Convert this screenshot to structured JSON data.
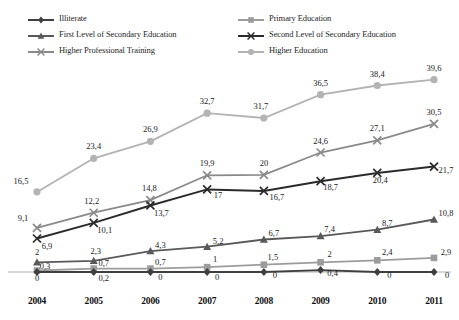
{
  "chart_data": {
    "type": "line",
    "title": "",
    "xlabel": "",
    "ylabel": "",
    "categories": [
      "2004",
      "2005",
      "2006",
      "2007",
      "2008",
      "2009",
      "2010",
      "2011"
    ],
    "ylim": [
      0,
      42
    ],
    "grid": false,
    "legend_position": "top",
    "series": [
      {
        "name": "Illiterate",
        "color": "#3f3f3f",
        "marker": "diamond",
        "values": [
          0,
          0,
          0,
          0,
          0,
          0.4,
          0,
          0
        ],
        "labels": [
          "0",
          "0,2",
          "0",
          "0",
          "0",
          "0,4",
          "0",
          "0"
        ]
      },
      {
        "name": "Primary Education",
        "color": "#9c9c9c",
        "marker": "square",
        "values": [
          0.3,
          0.7,
          0.7,
          1,
          1.5,
          2,
          2.4,
          2.9
        ],
        "labels": [
          "0,3",
          "0,7",
          "0,7",
          "1",
          "1,5",
          "2",
          "2,4",
          "2,9"
        ]
      },
      {
        "name": "First Level of Secondary Education",
        "color": "#595959",
        "marker": "triangle",
        "values": [
          2,
          2.3,
          4.3,
          5.2,
          6.7,
          7.4,
          8.7,
          10.8
        ],
        "labels": [
          "2",
          "2,3",
          "4,3",
          "5,2",
          "6,7",
          "7,4",
          "8,7",
          "10,8"
        ]
      },
      {
        "name": "Second Level of Secondary Education",
        "color": "#2b2b2b",
        "marker": "cross",
        "values": [
          6.9,
          10.1,
          13.7,
          17,
          16.7,
          18.7,
          20.4,
          21.7
        ],
        "labels": [
          "6,9",
          "10,1",
          "13,7",
          "17",
          "16,7",
          "18,7",
          "20,4",
          "21,7"
        ]
      },
      {
        "name": "Higher Professional Training",
        "color": "#8a8a8a",
        "marker": "cross",
        "values": [
          9.1,
          12.2,
          14.8,
          19.9,
          20,
          24.6,
          27.1,
          30.5
        ],
        "labels": [
          "9,1",
          "12,2",
          "14,8",
          "19,9",
          "20",
          "24,6",
          "27,1",
          "30,5"
        ]
      },
      {
        "name": "Higher Education",
        "color": "#b3b3b3",
        "marker": "circle",
        "values": [
          16.5,
          23.4,
          26.9,
          32.7,
          31.7,
          36.5,
          38.4,
          39.6
        ],
        "labels": [
          "16,5",
          "23,4",
          "26,9",
          "32,7",
          "31,7",
          "36,5",
          "38,4",
          "39,6"
        ]
      }
    ]
  },
  "legend": {
    "left_column": [
      {
        "label": "Illiterate",
        "series": 0
      },
      {
        "label": "First Level of Secondary Education",
        "series": 2
      },
      {
        "label": "Higher Professional Training",
        "series": 4
      }
    ],
    "right_column": [
      {
        "label": "Primary Education",
        "series": 1
      },
      {
        "label": "Second Level of Secondary Education",
        "series": 3
      },
      {
        "label": "Higher Education",
        "series": 5
      }
    ]
  },
  "axis": {
    "baseline_color": "#b0b0b0",
    "tick_labels": [
      "2004",
      "2005",
      "2006",
      "2007",
      "2008",
      "2009",
      "2010",
      "2011"
    ]
  }
}
